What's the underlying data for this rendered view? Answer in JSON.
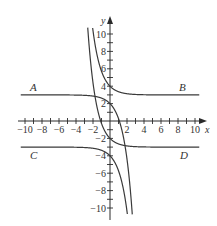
{
  "chart_data": {
    "type": "line",
    "title": "",
    "xlabel": "x",
    "ylabel": "y",
    "xlim": [
      -10.5,
      10.5
    ],
    "ylim": [
      -11,
      11
    ],
    "grid": false,
    "x_ticks": [
      -10,
      -8,
      -6,
      -4,
      -2,
      2,
      4,
      6,
      8,
      10
    ],
    "y_ticks": [
      -10,
      -8,
      -6,
      -4,
      -2,
      2,
      4,
      6,
      8,
      10
    ],
    "x_tick_labels": [
      "−10",
      "−8",
      "−6",
      "−4",
      "−2",
      "2",
      "4",
      "6",
      "8",
      "10"
    ],
    "y_tick_labels": [
      "−10",
      "−8",
      "−6",
      "−4",
      "−2",
      "2",
      "4",
      "6",
      "8",
      "10"
    ],
    "series": [
      {
        "name": "A",
        "formula": "y = 3 - e^x",
        "horizontal_asymptote": 3,
        "y_intercept": 2,
        "label_side": "left"
      },
      {
        "name": "B",
        "formula": "y = 3 + e^(-x)",
        "horizontal_asymptote": 3,
        "y_intercept": 4,
        "label_side": "right"
      },
      {
        "name": "C",
        "formula": "y = -3 - e^x",
        "horizontal_asymptote": -3,
        "y_intercept": -4,
        "label_side": "left"
      },
      {
        "name": "D",
        "formula": "y = -3 + e^(-x)",
        "horizontal_asymptote": -3,
        "y_intercept": -2,
        "label_side": "right"
      }
    ]
  },
  "labels": {
    "x_axis": "x",
    "y_axis": "y",
    "A": "A",
    "B": "B",
    "C": "C",
    "D": "D"
  }
}
